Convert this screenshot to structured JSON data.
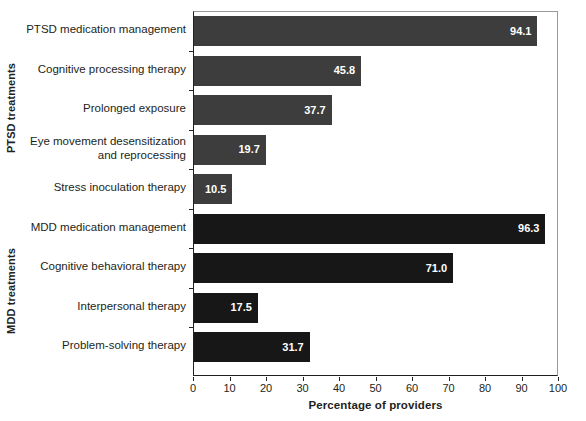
{
  "chart_data": {
    "type": "bar",
    "orientation": "horizontal",
    "title": "",
    "xlabel": "Percentage of providers",
    "ylabel": "",
    "xlim": [
      0,
      100
    ],
    "xticks": [
      0,
      10,
      20,
      30,
      40,
      50,
      60,
      70,
      80,
      90,
      100
    ],
    "grid": false,
    "legend": false,
    "groups": [
      {
        "name": "PTSD treatments",
        "color": "#3d3d3d",
        "categories": [
          "PTSD medication management",
          "Cognitive processing therapy",
          "Prolonged exposure",
          "Eye movement desensitization\nand reprocessing",
          "Stress inoculation therapy"
        ],
        "values": [
          94.1,
          45.8,
          37.7,
          19.7,
          10.5
        ],
        "value_labels": [
          "94.1",
          "45.8",
          "37.7",
          "19.7",
          "10.5"
        ]
      },
      {
        "name": "MDD treatments",
        "color": "#171717",
        "categories": [
          "MDD medication management",
          "Cognitive behavioral therapy",
          "Interpersonal therapy",
          "Problem-solving therapy"
        ],
        "values": [
          96.3,
          71.0,
          17.5,
          31.7
        ],
        "value_labels": [
          "96.3",
          "71.0",
          "17.5",
          "31.7"
        ]
      }
    ],
    "categories": [
      "PTSD medication management",
      "Cognitive processing therapy",
      "Prolonged exposure",
      "Eye movement desensitization and reprocessing",
      "Stress inoculation therapy",
      "MDD medication management",
      "Cognitive behavioral therapy",
      "Interpersonal therapy",
      "Problem-solving therapy"
    ],
    "values": [
      94.1,
      45.8,
      37.7,
      19.7,
      10.5,
      96.3,
      71.0,
      17.5,
      31.7
    ]
  },
  "axes": {
    "x_title": "Percentage of providers",
    "tick_labels": [
      "0",
      "10",
      "20",
      "30",
      "40",
      "50",
      "60",
      "70",
      "80",
      "90",
      "100"
    ]
  },
  "group_titles": {
    "ptsd": "PTSD treatments",
    "mdd": "MDD treatments"
  },
  "bars": [
    {
      "label": "PTSD medication management",
      "value_label": "94.1",
      "value": 94.1,
      "group": "ptsd"
    },
    {
      "label": "Cognitive processing therapy",
      "value_label": "45.8",
      "value": 45.8,
      "group": "ptsd"
    },
    {
      "label": "Prolonged exposure",
      "value_label": "37.7",
      "value": 37.7,
      "group": "ptsd"
    },
    {
      "label": "Eye movement desensitization\nand reprocessing",
      "value_label": "19.7",
      "value": 19.7,
      "group": "ptsd"
    },
    {
      "label": "Stress inoculation therapy",
      "value_label": "10.5",
      "value": 10.5,
      "group": "ptsd"
    },
    {
      "label": "MDD medication management",
      "value_label": "96.3",
      "value": 96.3,
      "group": "mdd"
    },
    {
      "label": "Cognitive behavioral therapy",
      "value_label": "71.0",
      "value": 71.0,
      "group": "mdd"
    },
    {
      "label": "Interpersonal therapy",
      "value_label": "17.5",
      "value": 17.5,
      "group": "mdd"
    },
    {
      "label": "Problem-solving therapy",
      "value_label": "31.7",
      "value": 31.7,
      "group": "mdd"
    }
  ],
  "colors": {
    "ptsd_bar": "#3d3d3d",
    "mdd_bar": "#171717",
    "axis": "#231f20",
    "background": "#ffffff"
  }
}
